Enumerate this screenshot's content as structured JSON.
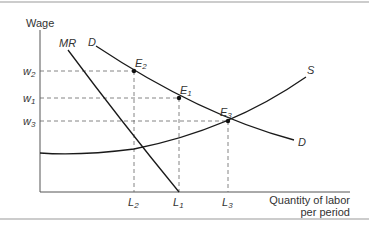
{
  "diagram": {
    "y_axis_label": "Wage",
    "x_axis_label_line1": "Quantity of labor",
    "x_axis_label_line2": "per period",
    "curves": {
      "mr": "MR",
      "demand_top": "D",
      "demand_bottom": "D",
      "supply": "S"
    },
    "wage_ticks": [
      {
        "base": "w",
        "sub": "2"
      },
      {
        "base": "w",
        "sub": "1"
      },
      {
        "base": "w",
        "sub": "3"
      }
    ],
    "quantity_ticks": [
      {
        "base": "L",
        "sub": "2"
      },
      {
        "base": "L",
        "sub": "1"
      },
      {
        "base": "L",
        "sub": "3"
      }
    ],
    "points": [
      {
        "base": "E",
        "sub": "2"
      },
      {
        "base": "E",
        "sub": "1"
      },
      {
        "base": "E",
        "sub": "3"
      }
    ],
    "colors": {
      "line": "#1a1a1a",
      "dashed": "#555555",
      "border": "#bbbbbb",
      "text": "#333333"
    }
  }
}
